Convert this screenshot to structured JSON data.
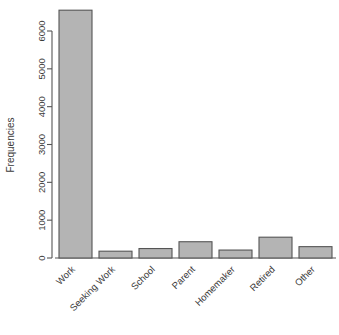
{
  "chart_data": {
    "type": "bar",
    "title": "",
    "subtitle": "",
    "xlabel": "",
    "ylabel": "Frequencies",
    "categories": [
      "Work",
      "Seeking Work",
      "School",
      "Parent",
      "Homemaker",
      "Retired",
      "Other"
    ],
    "values": [
      6550,
      180,
      250,
      430,
      210,
      550,
      300
    ],
    "series": [
      {
        "name": "Frequencies",
        "values": [
          6550,
          180,
          250,
          430,
          210,
          550,
          300
        ]
      }
    ],
    "ylim": [
      0,
      6000
    ],
    "y_ticks": [
      0,
      1000,
      2000,
      3000,
      4000,
      5000,
      6000
    ],
    "y_tick_labels": [
      "0",
      "1000",
      "2000",
      "3000",
      "4000",
      "5000",
      "6000"
    ],
    "grid": false,
    "legend": false,
    "legend_position": "none",
    "bar_fill_color": "#b4b4b4",
    "bar_border_color": "#555555",
    "axis_color": "#555555",
    "text_color": "#3b3b3b",
    "background_color": "#ffffff",
    "x_tick_label_rotation": -45,
    "y_tick_label_rotation": -90
  }
}
